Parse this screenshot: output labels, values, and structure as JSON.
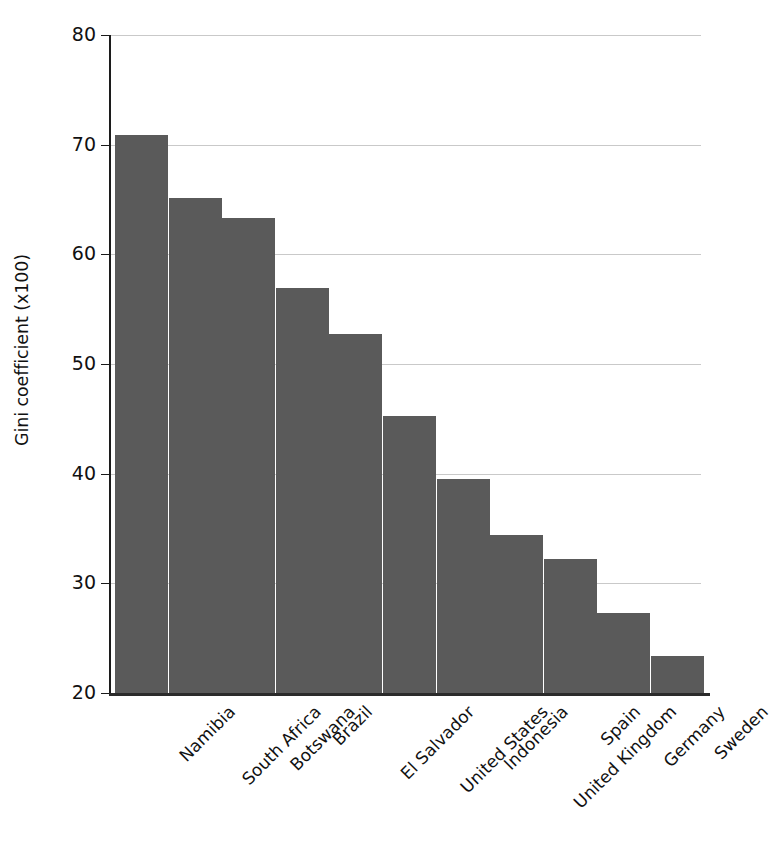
{
  "chart_data": {
    "type": "bar",
    "title": "",
    "subtitle": "",
    "xlabel": "",
    "ylabel": "Gini coefficient (x100)",
    "categories": [
      "Namibia",
      "South Africa",
      "Botswana",
      "Brazil",
      "El Salvador",
      "United States",
      "Indonesia",
      "United Kingdom",
      "Spain",
      "Germany",
      "Sweden"
    ],
    "values": [
      70.9,
      65.1,
      63.3,
      56.9,
      52.7,
      45.3,
      39.5,
      34.4,
      32.2,
      27.3,
      23.4
    ],
    "ylim": [
      20,
      80
    ],
    "yticks": [
      "20",
      "30",
      "40",
      "50",
      "60",
      "70",
      "80"
    ],
    "ytick_values": [
      20,
      30,
      40,
      50,
      60,
      70,
      80
    ],
    "grid": true,
    "legend": "none",
    "bar_color": "#5a5a5a",
    "grid_color": "#c9c9c9",
    "axis_color": "#1c1c1c",
    "background_color": "#ffffff"
  }
}
